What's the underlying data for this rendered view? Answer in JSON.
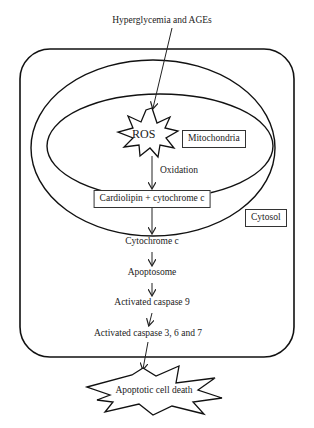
{
  "diagram": {
    "input": "Hyperglycemia and AGEs",
    "ros": "ROS",
    "mitochondria": "Mitochondria",
    "oxidation": "Oxidation",
    "cardiolipin": "Cardiolipin + cytochrome c",
    "cytosol": "Cytosol",
    "steps": [
      "Cytochrome c",
      "Apoptosome",
      "Activated caspase 9",
      "Activated caspase 3, 6 and 7"
    ],
    "outcome": "Apoptotic cell death"
  }
}
